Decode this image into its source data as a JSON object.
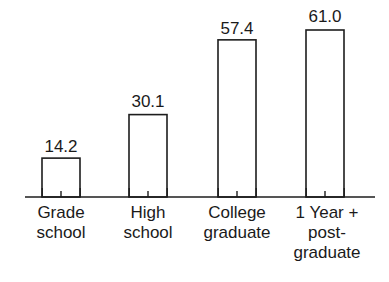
{
  "chart_data": {
    "type": "bar",
    "title": "",
    "subtitle": "",
    "xlabel": "",
    "ylabel": "",
    "categories": [
      "Grade school",
      "High school",
      "College graduate",
      "1 Year + post-graduate"
    ],
    "category_lines": [
      [
        "Grade",
        "school"
      ],
      [
        "High",
        "school"
      ],
      [
        "College",
        "graduate"
      ],
      [
        "1 Year +",
        "post-",
        "graduate"
      ]
    ],
    "values": [
      14.2,
      30.1,
      57.4,
      61.0
    ],
    "value_labels": [
      "14.2",
      "30.1",
      "57.4",
      "61.0"
    ],
    "ylim": [
      0,
      61.0
    ],
    "grid": false,
    "legend": false,
    "legend_position": "none",
    "axis_visible": {
      "x": true,
      "y": false
    },
    "bar_style": "outline",
    "colors": {
      "bar_fill": "#ffffff",
      "bar_stroke": "#1d1d1d",
      "axis": "#1d1d1d",
      "text": "#1a1a1a",
      "background": "#ffffff"
    }
  },
  "geometry": {
    "baseline_y": 197,
    "axis_x_start": 25,
    "axis_x_end": 375,
    "bar_width": 38,
    "bar_centers": [
      61,
      148,
      237,
      325
    ],
    "bar_tops": [
      160,
      115,
      42,
      30
    ],
    "value_label_y": [
      152,
      107,
      34,
      22
    ],
    "cat_label_start_y": 217,
    "cat_line_height": 20,
    "tick_len_outer": 9,
    "tick_len_center": 6
  }
}
